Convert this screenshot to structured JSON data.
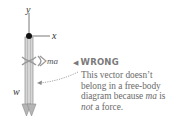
{
  "diagram": {
    "axes": {
      "y_label": "y",
      "x_label": "x"
    },
    "vectors": [
      {
        "label": "w",
        "kind": "force",
        "status": "valid"
      },
      {
        "label": "ma",
        "kind": "not-a-force",
        "status": "crossed-out"
      }
    ],
    "annotation": {
      "marker": "◀",
      "heading": "WRONG",
      "text_part1": "This vector doesn’t belong in a free-body diagram because ",
      "text_ma": "ma",
      "text_part2": " is ",
      "text_not": "not",
      "text_part3": " a force."
    },
    "colors": {
      "vector_fill": "#c9c9c9",
      "vector_stroke": "#8c8c8c",
      "text": "#6a6a6a",
      "dot": "#111111"
    }
  }
}
